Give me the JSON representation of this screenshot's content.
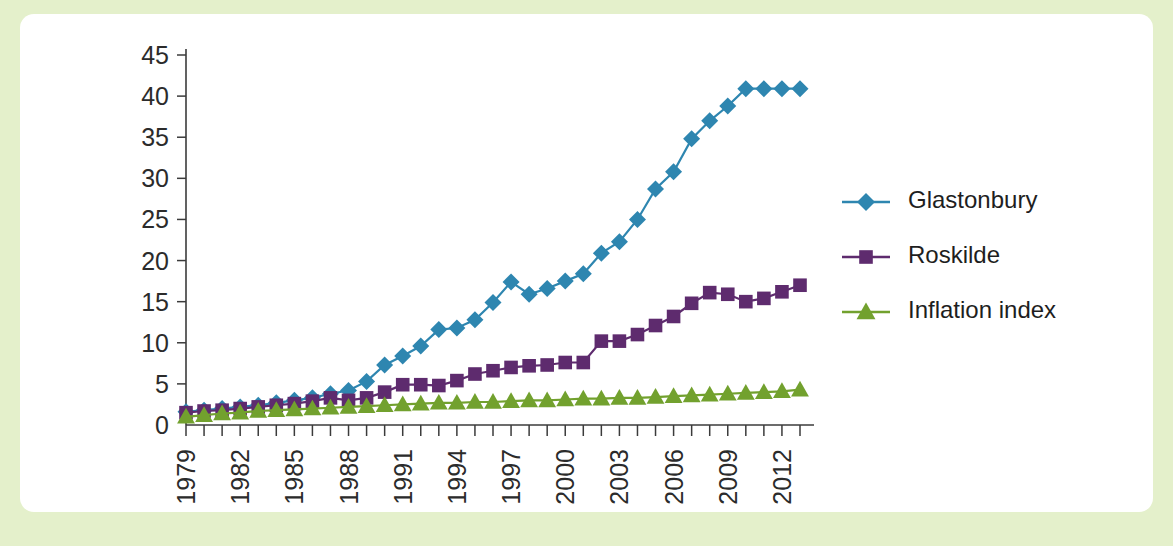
{
  "figure": {
    "background_color": "#e4f0cb",
    "card_color": "#ffffff"
  },
  "chart_data": {
    "type": "line",
    "title": "",
    "subtitle": "",
    "xlabel": "",
    "ylabel": "",
    "grid": false,
    "legend_position": "right",
    "xlim": [
      1979,
      2013
    ],
    "ylim": [
      0,
      45
    ],
    "yticks": [
      0,
      5,
      10,
      15,
      20,
      25,
      30,
      35,
      40,
      45
    ],
    "ytick_labels": [
      "0",
      "5",
      "10",
      "15",
      "20",
      "25",
      "30",
      "35",
      "40",
      "45"
    ],
    "xticks": [
      1979,
      1982,
      1985,
      1988,
      1991,
      1994,
      1997,
      2000,
      2003,
      2006,
      2009,
      2012
    ],
    "xtick_labels": [
      "1979",
      "1982",
      "1985",
      "1988",
      "1991",
      "1994",
      "1997",
      "2000",
      "2003",
      "2006",
      "2009",
      "2012"
    ],
    "xtick_rotation": 90,
    "x": [
      1979,
      1980,
      1981,
      1982,
      1983,
      1984,
      1985,
      1986,
      1987,
      1988,
      1989,
      1990,
      1991,
      1992,
      1993,
      1994,
      1995,
      1996,
      1997,
      1998,
      1999,
      2000,
      2001,
      2002,
      2003,
      2004,
      2005,
      2006,
      2007,
      2008,
      2009,
      2010,
      2011,
      2012,
      2013
    ],
    "series": [
      {
        "name": "Glastonbury",
        "color": "#2e86b0",
        "marker": "diamond",
        "values": [
          1.6,
          1.8,
          2.0,
          2.2,
          2.4,
          2.7,
          3.0,
          3.3,
          3.8,
          4.2,
          5.3,
          7.3,
          8.4,
          9.6,
          11.6,
          11.8,
          12.8,
          14.9,
          17.4,
          15.9,
          16.6,
          17.5,
          18.4,
          20.9,
          22.3,
          25.0,
          28.7,
          30.8,
          34.8,
          37.0,
          38.8,
          40.9,
          40.9,
          40.9,
          40.9
        ]
      },
      {
        "name": "Roskilde",
        "color": "#5e2b6e",
        "marker": "square",
        "values": [
          1.5,
          1.7,
          1.8,
          2.0,
          2.2,
          2.4,
          2.6,
          2.9,
          3.3,
          3.0,
          3.3,
          4.0,
          4.9,
          4.9,
          4.8,
          5.4,
          6.2,
          6.6,
          7.0,
          7.2,
          7.3,
          7.6,
          7.6,
          10.2,
          10.2,
          11.0,
          12.1,
          13.2,
          14.8,
          16.1,
          15.9,
          15.0,
          15.4,
          16.2,
          17.0
        ]
      },
      {
        "name": "Inflation index",
        "color": "#72a12e",
        "marker": "triangle",
        "values": [
          1.0,
          1.2,
          1.4,
          1.5,
          1.7,
          1.8,
          1.9,
          2.0,
          2.1,
          2.2,
          2.3,
          2.4,
          2.5,
          2.6,
          2.7,
          2.7,
          2.8,
          2.8,
          2.9,
          3.0,
          3.0,
          3.1,
          3.2,
          3.2,
          3.3,
          3.3,
          3.4,
          3.5,
          3.6,
          3.7,
          3.8,
          3.9,
          4.0,
          4.1,
          4.3
        ]
      }
    ]
  },
  "legend": {
    "entries": [
      {
        "label": "Glastonbury"
      },
      {
        "label": "Roskilde"
      },
      {
        "label": "Inflation index"
      }
    ]
  }
}
